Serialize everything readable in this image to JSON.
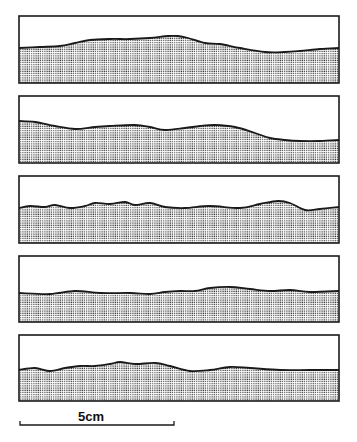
{
  "figure": {
    "type": "stacked surface profile cross-sections",
    "colors": {
      "stroke": "#1a1a1a",
      "fill_dot": "#3a3a3a",
      "background": "#ffffff"
    },
    "panels": [
      {
        "id": 1,
        "box": [
          19,
          16,
          339,
          83
        ],
        "surface": [
          [
            19,
            48
          ],
          [
            40,
            47
          ],
          [
            60,
            46
          ],
          [
            75,
            43
          ],
          [
            90,
            40
          ],
          [
            110,
            39
          ],
          [
            130,
            39
          ],
          [
            150,
            38
          ],
          [
            168,
            36
          ],
          [
            178,
            36
          ],
          [
            188,
            38
          ],
          [
            205,
            43
          ],
          [
            220,
            44
          ],
          [
            240,
            48
          ],
          [
            265,
            52
          ],
          [
            285,
            52
          ],
          [
            300,
            51
          ],
          [
            320,
            49
          ],
          [
            339,
            48
          ]
        ]
      },
      {
        "id": 2,
        "box": [
          19,
          96,
          339,
          163
        ],
        "surface": [
          [
            19,
            121
          ],
          [
            35,
            122
          ],
          [
            55,
            126
          ],
          [
            75,
            129
          ],
          [
            95,
            127
          ],
          [
            110,
            126
          ],
          [
            135,
            125
          ],
          [
            150,
            127
          ],
          [
            165,
            130
          ],
          [
            185,
            128
          ],
          [
            200,
            126
          ],
          [
            215,
            125
          ],
          [
            235,
            127
          ],
          [
            255,
            133
          ],
          [
            270,
            138
          ],
          [
            285,
            140
          ],
          [
            300,
            141
          ],
          [
            320,
            141
          ],
          [
            339,
            140
          ]
        ]
      },
      {
        "id": 3,
        "box": [
          19,
          176,
          339,
          243
        ],
        "surface": [
          [
            19,
            208
          ],
          [
            30,
            206
          ],
          [
            45,
            207
          ],
          [
            55,
            205
          ],
          [
            70,
            208
          ],
          [
            85,
            206
          ],
          [
            95,
            203
          ],
          [
            110,
            204
          ],
          [
            125,
            202
          ],
          [
            135,
            205
          ],
          [
            150,
            203
          ],
          [
            165,
            207
          ],
          [
            185,
            208
          ],
          [
            210,
            206
          ],
          [
            240,
            208
          ],
          [
            260,
            204
          ],
          [
            278,
            201
          ],
          [
            290,
            203
          ],
          [
            305,
            210
          ],
          [
            320,
            209
          ],
          [
            339,
            207
          ]
        ]
      },
      {
        "id": 4,
        "box": [
          19,
          256,
          339,
          322
        ],
        "surface": [
          [
            19,
            293
          ],
          [
            50,
            294
          ],
          [
            75,
            291
          ],
          [
            100,
            293
          ],
          [
            130,
            293
          ],
          [
            150,
            294
          ],
          [
            165,
            292
          ],
          [
            180,
            291
          ],
          [
            195,
            291
          ],
          [
            210,
            288
          ],
          [
            230,
            287
          ],
          [
            250,
            289
          ],
          [
            270,
            291
          ],
          [
            290,
            290
          ],
          [
            310,
            292
          ],
          [
            339,
            291
          ]
        ]
      },
      {
        "id": 5,
        "box": [
          19,
          335,
          339,
          401
        ],
        "surface": [
          [
            19,
            370
          ],
          [
            35,
            368
          ],
          [
            50,
            371
          ],
          [
            65,
            368
          ],
          [
            80,
            366
          ],
          [
            95,
            366
          ],
          [
            110,
            364
          ],
          [
            120,
            362
          ],
          [
            135,
            364
          ],
          [
            155,
            363
          ],
          [
            170,
            366
          ],
          [
            190,
            371
          ],
          [
            210,
            370
          ],
          [
            230,
            367
          ],
          [
            250,
            368
          ],
          [
            280,
            370
          ],
          [
            310,
            370
          ],
          [
            339,
            370
          ]
        ]
      }
    ]
  },
  "scale_bar": {
    "label": "5cm",
    "x1": 20,
    "x2": 174,
    "y": 425
  }
}
